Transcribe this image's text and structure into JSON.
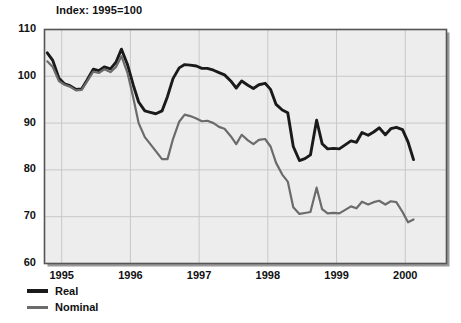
{
  "chart_data": {
    "type": "line",
    "title": "Index: 1995=100",
    "xlabel": "",
    "ylabel": "",
    "xlim": [
      1994.75,
      2000.6
    ],
    "ylim": [
      60,
      110
    ],
    "yticks": [
      60,
      70,
      80,
      90,
      100,
      110
    ],
    "xticks": [
      1995,
      1996,
      1997,
      1998,
      1999,
      2000
    ],
    "grid": true,
    "legend_position": "below-left",
    "colors": {
      "real": "#1a1a1a",
      "nominal": "#6b6b6b",
      "plot_background": "#ededed",
      "gridline": "#c8c8c8",
      "axis": "#555555",
      "text": "#111111"
    },
    "series": [
      {
        "name": "Real",
        "x": [
          1994.79,
          1994.87,
          1994.96,
          1995.04,
          1995.12,
          1995.21,
          1995.29,
          1995.37,
          1995.46,
          1995.54,
          1995.62,
          1995.71,
          1995.79,
          1995.87,
          1995.96,
          1996.04,
          1996.12,
          1996.21,
          1996.29,
          1996.37,
          1996.46,
          1996.54,
          1996.62,
          1996.71,
          1996.79,
          1996.87,
          1996.96,
          1997.04,
          1997.12,
          1997.21,
          1997.29,
          1997.37,
          1997.46,
          1997.54,
          1997.62,
          1997.71,
          1997.79,
          1997.87,
          1997.96,
          1998.04,
          1998.12,
          1998.21,
          1998.29,
          1998.37,
          1998.46,
          1998.54,
          1998.62,
          1998.71,
          1998.79,
          1998.87,
          1998.96,
          1999.04,
          1999.12,
          1999.21,
          1999.29,
          1999.37,
          1999.46,
          1999.54,
          1999.62,
          1999.71,
          1999.79,
          1999.87,
          1999.96,
          2000.04,
          2000.12
        ],
        "values": [
          105.0,
          103.4,
          99.6,
          98.4,
          98.0,
          97.2,
          97.3,
          99.2,
          101.5,
          101.2,
          102.0,
          101.6,
          103.0,
          105.8,
          102.4,
          98.2,
          94.5,
          92.6,
          92.3,
          92.0,
          92.6,
          95.7,
          99.5,
          101.8,
          102.5,
          102.4,
          102.2,
          101.7,
          101.7,
          101.3,
          100.8,
          100.3,
          99.0,
          97.5,
          99.0,
          98.1,
          97.4,
          98.2,
          98.5,
          97.2,
          94.0,
          92.8,
          92.2,
          85.0,
          82.0,
          82.4,
          83.2,
          90.6,
          85.6,
          84.5,
          84.6,
          84.5,
          85.3,
          86.2,
          85.9,
          88.0,
          87.4,
          88.1,
          89.0,
          87.5,
          88.8,
          89.1,
          88.6,
          86.0,
          82.2
        ]
      },
      {
        "name": "Nominal",
        "x": [
          1994.79,
          1994.87,
          1994.96,
          1995.04,
          1995.12,
          1995.21,
          1995.29,
          1995.37,
          1995.46,
          1995.54,
          1995.62,
          1995.71,
          1995.79,
          1995.87,
          1995.96,
          1996.04,
          1996.12,
          1996.21,
          1996.29,
          1996.37,
          1996.46,
          1996.54,
          1996.62,
          1996.71,
          1996.79,
          1996.87,
          1996.96,
          1997.04,
          1997.12,
          1997.21,
          1997.29,
          1997.37,
          1997.46,
          1997.54,
          1997.62,
          1997.71,
          1997.79,
          1997.87,
          1997.96,
          1998.04,
          1998.12,
          1998.21,
          1998.29,
          1998.37,
          1998.46,
          1998.54,
          1998.62,
          1998.71,
          1998.79,
          1998.87,
          1998.96,
          1999.04,
          1999.12,
          1999.21,
          1999.29,
          1999.37,
          1999.46,
          1999.54,
          1999.62,
          1999.71,
          1999.79,
          1999.87,
          1999.96,
          2000.04,
          2000.12
        ],
        "values": [
          103.2,
          102.0,
          99.0,
          98.2,
          97.8,
          97.0,
          97.1,
          98.9,
          101.0,
          100.7,
          101.5,
          100.9,
          102.0,
          104.3,
          100.6,
          95.5,
          90.0,
          87.0,
          85.5,
          84.0,
          82.3,
          82.3,
          86.6,
          90.3,
          91.8,
          91.5,
          91.0,
          90.4,
          90.5,
          90.0,
          89.2,
          88.8,
          87.2,
          85.5,
          87.5,
          86.3,
          85.5,
          86.4,
          86.6,
          85.0,
          81.5,
          79.0,
          77.5,
          72.0,
          70.6,
          70.8,
          71.0,
          76.2,
          71.6,
          70.7,
          70.8,
          70.7,
          71.4,
          72.2,
          71.8,
          73.2,
          72.6,
          73.1,
          73.4,
          72.6,
          73.3,
          73.1,
          71.0,
          68.8,
          69.4
        ]
      }
    ]
  },
  "legend": {
    "items": [
      {
        "label": "Real",
        "key": "real"
      },
      {
        "label": "Nominal",
        "key": "nominal"
      }
    ]
  }
}
